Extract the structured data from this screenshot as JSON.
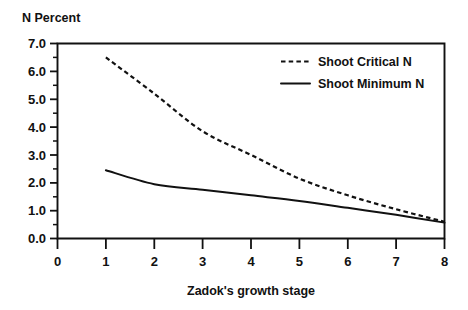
{
  "chart_data": {
    "type": "line",
    "title": "",
    "ylabel": "N Percent",
    "xlabel": "Zadok's growth stage",
    "xlim": [
      0,
      8
    ],
    "ylim": [
      0,
      7
    ],
    "grid": false,
    "legend_position": "top-right",
    "x_ticks": [
      "0",
      "1",
      "2",
      "3",
      "4",
      "5",
      "6",
      "7",
      "8"
    ],
    "y_ticks": [
      "0.0",
      "1.0",
      "2.0",
      "3.0",
      "4.0",
      "5.0",
      "6.0",
      "7.0"
    ],
    "y_minor_tick_step": 0.5,
    "x": [
      1,
      2,
      3,
      4,
      5,
      6,
      7,
      8
    ],
    "series": [
      {
        "name": "Shoot Critical N",
        "style": "dashed",
        "color": "#111111",
        "values": [
          6.5,
          5.2,
          3.85,
          3.0,
          2.15,
          1.55,
          1.05,
          0.6
        ]
      },
      {
        "name": "Shoot Minimum N",
        "style": "solid",
        "color": "#111111",
        "values": [
          2.45,
          1.95,
          1.75,
          1.55,
          1.35,
          1.1,
          0.85,
          0.57
        ]
      }
    ]
  },
  "legend": {
    "items": [
      {
        "label": "Shoot Critical N",
        "style": "dashed"
      },
      {
        "label": "Shoot Minimum N",
        "style": "solid"
      }
    ]
  }
}
